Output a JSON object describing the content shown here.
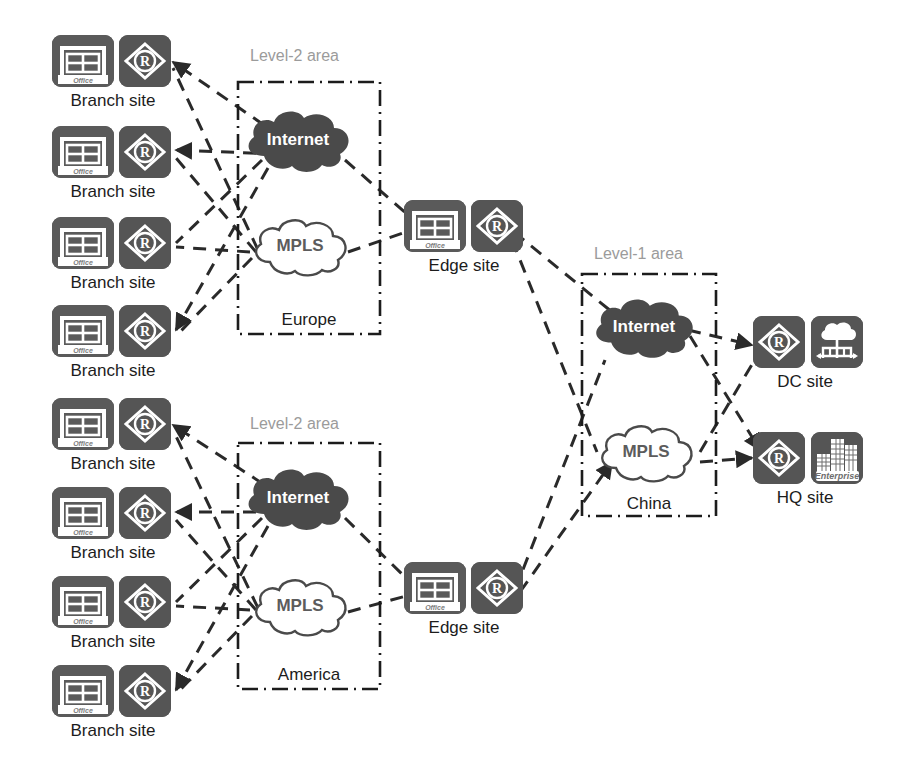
{
  "diagram": {
    "type": "network-topology",
    "background": "#ffffff",
    "colors": {
      "icon_tile": "#555555",
      "internet_cloud": "#4a4a4a",
      "mpls_cloud_fill": "#ffffff",
      "mpls_cloud_stroke": "#4a4a4a",
      "link_dash": "#2a2a2a",
      "area_border": "#1c1c1c",
      "area_caption": "#9b9b9b",
      "label_text": "#1c1c1c"
    }
  },
  "areas": [
    {
      "id": "europe",
      "caption": "Level-2 area",
      "name": "Europe",
      "clouds": [
        {
          "id": "europe-internet",
          "label": "Internet",
          "style": "dark"
        },
        {
          "id": "europe-mpls",
          "label": "MPLS",
          "style": "light"
        }
      ]
    },
    {
      "id": "america",
      "caption": "Level-2 area",
      "name": "America",
      "clouds": [
        {
          "id": "america-internet",
          "label": "Internet",
          "style": "dark"
        },
        {
          "id": "america-mpls",
          "label": "MPLS",
          "style": "light"
        }
      ]
    },
    {
      "id": "china",
      "caption": "Level-1 area",
      "name": "China",
      "clouds": [
        {
          "id": "china-internet",
          "label": "Internet",
          "style": "dark"
        },
        {
          "id": "china-mpls",
          "label": "MPLS",
          "style": "light"
        }
      ]
    }
  ],
  "sites": {
    "branch_label": "Branch site",
    "edge_label": "Edge site",
    "dc_label": "DC site",
    "hq_label": "HQ site",
    "branches_europe": [
      {
        "label": "Branch site"
      },
      {
        "label": "Branch site"
      },
      {
        "label": "Branch site"
      },
      {
        "label": "Branch site"
      }
    ],
    "branches_america": [
      {
        "label": "Branch site"
      },
      {
        "label": "Branch site"
      },
      {
        "label": "Branch site"
      },
      {
        "label": "Branch site"
      }
    ],
    "edges": [
      {
        "label": "Edge site"
      },
      {
        "label": "Edge site"
      }
    ],
    "dc": {
      "label": "DC site"
    },
    "hq": {
      "label": "HQ site"
    }
  },
  "icons": {
    "office_badge": "Office",
    "enterprise_badge": "Enterprise",
    "router_glyph": "R",
    "office_icon": "office-building-icon",
    "router_icon": "router-icon",
    "datacenter_icon": "cloud-datacenter-icon",
    "enterprise_icon": "enterprise-buildings-icon"
  }
}
